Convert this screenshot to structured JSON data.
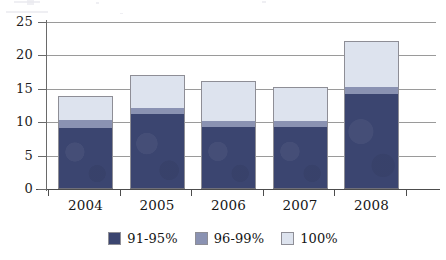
{
  "chart_data": {
    "type": "bar",
    "subtype": "stacked-bar",
    "title": "",
    "subtitle": "",
    "xlabel": "",
    "ylabel": "",
    "categories": [
      "2004",
      "2005",
      "2006",
      "2007",
      "2008"
    ],
    "series": [
      {
        "name": "91-95%",
        "color": "#3b4570",
        "values": [
          9.2,
          11.3,
          9.3,
          9.3,
          14.2
        ]
      },
      {
        "name": "96-99%",
        "color": "#8a92b2",
        "values": [
          1.1,
          0.9,
          0.9,
          0.9,
          1.0
        ]
      },
      {
        "name": "100%",
        "color": "#dde3ee",
        "values": [
          3.7,
          4.8,
          5.9,
          5.0,
          7.0
        ]
      }
    ],
    "totals": [
      14.0,
      17.0,
      16.1,
      15.2,
      22.2
    ],
    "ylim": [
      0,
      25
    ],
    "ytick_values": [
      0,
      5,
      10,
      15,
      20,
      25
    ],
    "ytick_labels": [
      "0",
      "5",
      "10",
      "15",
      "20",
      "25"
    ],
    "grid": "horizontal",
    "legend_position": "bottom"
  },
  "axis": {
    "y_labels": [
      "25",
      "20",
      "15",
      "10",
      "5",
      "0"
    ],
    "x_labels": [
      "2004",
      "2005",
      "2006",
      "2007",
      "2008"
    ]
  },
  "legend": {
    "items": [
      {
        "label": "91-95%",
        "color": "#3b4570"
      },
      {
        "label": "96-99%",
        "color": "#8a92b2"
      },
      {
        "label": "100%",
        "color": "#dde3ee"
      }
    ]
  }
}
